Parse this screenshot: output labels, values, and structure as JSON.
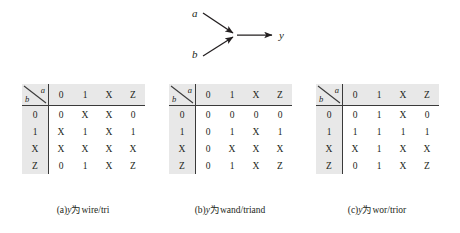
{
  "diagram": {
    "input_a_label": "a",
    "input_b_label": "b",
    "output_label": "y"
  },
  "tables": [
    {
      "id": "wire-tri",
      "col_header_var": "a",
      "row_header_var": "b",
      "col_headers": [
        "0",
        "1",
        "X",
        "Z"
      ],
      "row_headers": [
        "0",
        "1",
        "X",
        "Z"
      ],
      "rows": [
        [
          "0",
          "X",
          "X",
          "0"
        ],
        [
          "X",
          "1",
          "X",
          "1"
        ],
        [
          "X",
          "X",
          "X",
          "X"
        ],
        [
          "0",
          "1",
          "X",
          "Z"
        ]
      ],
      "caption_index": "(a)",
      "caption_var": "y",
      "caption_middle": "为",
      "caption_types": "wire/tri"
    },
    {
      "id": "wand-triand",
      "col_header_var": "a",
      "row_header_var": "b",
      "col_headers": [
        "0",
        "1",
        "X",
        "Z"
      ],
      "row_headers": [
        "0",
        "1",
        "X",
        "Z"
      ],
      "rows": [
        [
          "0",
          "0",
          "0",
          "0"
        ],
        [
          "0",
          "1",
          "X",
          "1"
        ],
        [
          "0",
          "X",
          "X",
          "X"
        ],
        [
          "0",
          "1",
          "X",
          "Z"
        ]
      ],
      "caption_index": "(b)",
      "caption_var": "y",
      "caption_middle": "为",
      "caption_types": "wand/triand"
    },
    {
      "id": "wor-trior",
      "col_header_var": "a",
      "row_header_var": "b",
      "col_headers": [
        "0",
        "1",
        "X",
        "Z"
      ],
      "row_headers": [
        "0",
        "1",
        "X",
        "Z"
      ],
      "rows": [
        [
          "0",
          "1",
          "X",
          "0"
        ],
        [
          "1",
          "1",
          "1",
          "1"
        ],
        [
          "X",
          "1",
          "X",
          "X"
        ],
        [
          "0",
          "1",
          "X",
          "Z"
        ]
      ],
      "caption_index": "(c)",
      "caption_var": "y",
      "caption_middle": "为",
      "caption_types": "wor/trior"
    }
  ],
  "colors": {
    "background": "#ffffff",
    "text": "#231f20",
    "shading": "#e8e8e8",
    "rule": "#3a3a3a"
  }
}
